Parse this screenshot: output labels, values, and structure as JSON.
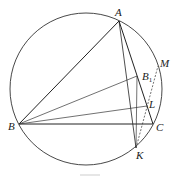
{
  "figure": {
    "type": "geometry-diagram",
    "circle": {
      "cx": 86,
      "cy": 89,
      "r": 76
    },
    "points": {
      "A": {
        "label": "A",
        "x": 119,
        "y": 21,
        "lx": 115,
        "ly": 16
      },
      "B": {
        "label": "B",
        "x": 19,
        "y": 124,
        "lx": 8,
        "ly": 130
      },
      "C": {
        "label": "C",
        "x": 153,
        "y": 124,
        "lx": 156,
        "ly": 131
      },
      "B1": {
        "label": "B",
        "sub": "1",
        "x": 137,
        "y": 76,
        "lx": 142,
        "ly": 80
      },
      "L": {
        "label": "L",
        "x": 147,
        "y": 106,
        "lx": 149,
        "ly": 108
      },
      "M": {
        "label": "M",
        "x": 158,
        "y": 66,
        "lx": 160,
        "ly": 67
      },
      "K": {
        "label": "K",
        "x": 136,
        "y": 148,
        "lx": 136,
        "ly": 159
      }
    },
    "segments": [
      {
        "from": "A",
        "to": "B",
        "style": "solid"
      },
      {
        "from": "A",
        "to": "C",
        "style": "solid"
      },
      {
        "from": "B",
        "to": "C",
        "style": "solid"
      },
      {
        "from": "A",
        "to": "K",
        "style": "solid"
      },
      {
        "from": "B",
        "to": "B1",
        "style": "solid"
      },
      {
        "from": "B",
        "to": "L",
        "style": "solid"
      },
      {
        "from": "B1",
        "to": "K",
        "style": "solid"
      },
      {
        "from": "K",
        "to": "M",
        "style": "dashed"
      }
    ],
    "caption": ""
  }
}
